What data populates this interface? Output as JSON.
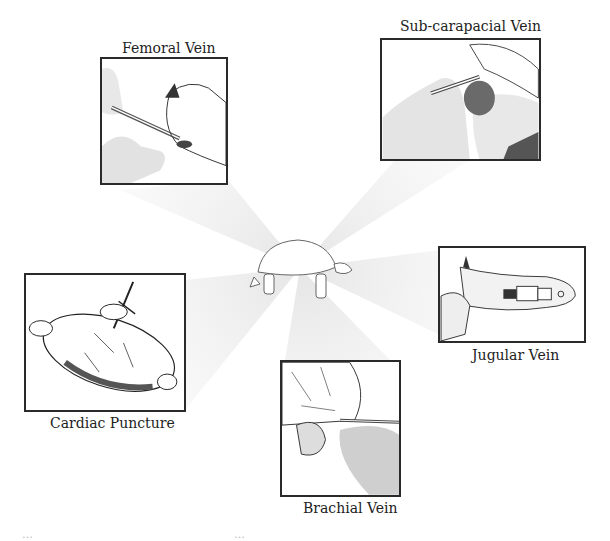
{
  "diagram": {
    "center": {
      "label": "turtle",
      "icon": "turtle-icon"
    },
    "panels": [
      {
        "id": "femoral",
        "caption": "Femoral Vein"
      },
      {
        "id": "subcarapacial",
        "caption": "Sub-carapacial Vein"
      },
      {
        "id": "jugular",
        "caption": "Jugular Vein"
      },
      {
        "id": "cardiac",
        "caption": "Cardiac Puncture"
      },
      {
        "id": "brachial",
        "caption": "Brachial Vein"
      }
    ],
    "colors": {
      "border": "#2a2a2a",
      "ray": "#e6e6e6",
      "text": "#222222",
      "background": "#ffffff"
    }
  },
  "footer": {
    "fragment_left": "…",
    "fragment_right": "…"
  }
}
